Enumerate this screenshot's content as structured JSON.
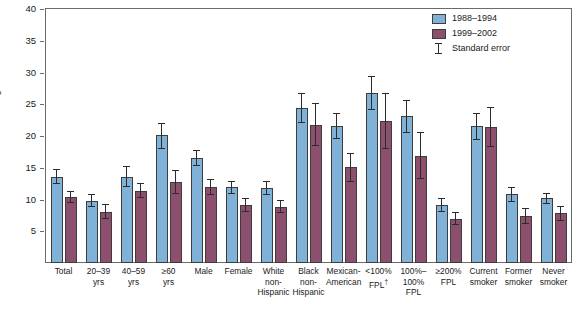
{
  "chart_data": {
    "type": "bar",
    "title": "",
    "xlabel": "",
    "ylabel": "Percentage",
    "ylim": [
      0,
      40
    ],
    "yticks": [
      0,
      5,
      10,
      15,
      20,
      25,
      30,
      35,
      40
    ],
    "ytick_labels": [
      "",
      "5",
      "10",
      "15",
      "20",
      "25",
      "30",
      "35",
      "40"
    ],
    "grid": false,
    "legend_position": "top-right",
    "legend": [
      "1988–1994",
      "1999–2002",
      "Standard error"
    ],
    "categories": [
      "Total",
      "20–39\nyrs",
      "40–59\nyrs",
      "≥60\nyrs",
      "Male",
      "Female",
      "White\nnon-\nHispanic",
      "Black\nnon-\nHispanic",
      "Mexican-\nAmerican",
      "<100%\nFPL†",
      "100%–\n100%\nFPL",
      "≥200%\nFPL",
      "Current\nsmoker",
      "Former\nsmoker",
      "Never\nsmoker"
    ],
    "series": [
      {
        "name": "1988–1994",
        "color": "#7fb2d6",
        "values": [
          13.6,
          9.8,
          13.6,
          20.1,
          16.5,
          11.9,
          11.8,
          24.4,
          21.6,
          26.8,
          23.1,
          9.2,
          21.5,
          10.8,
          10.2
        ],
        "err_low": [
          12.4,
          8.8,
          11.9,
          18.0,
          15.2,
          10.9,
          10.7,
          22.0,
          19.6,
          24.1,
          20.5,
          8.1,
          19.3,
          9.6,
          9.3
        ],
        "err_high": [
          14.8,
          10.8,
          15.3,
          22.1,
          17.8,
          12.9,
          12.9,
          26.8,
          23.6,
          29.5,
          25.7,
          10.3,
          23.7,
          12.0,
          11.1
        ]
      },
      {
        "name": "1999–2002",
        "color": "#8c4f6d",
        "values": [
          10.4,
          8.1,
          11.4,
          12.8,
          12.0,
          9.1,
          8.9,
          21.8,
          15.1,
          22.4,
          16.9,
          7.0,
          21.4,
          7.4,
          7.8
        ],
        "err_low": [
          9.4,
          6.9,
          10.2,
          10.9,
          10.7,
          8.0,
          7.9,
          18.4,
          12.8,
          18.0,
          13.2,
          6.0,
          18.3,
          6.1,
          6.6
        ],
        "err_high": [
          11.4,
          9.3,
          12.6,
          14.7,
          13.3,
          10.2,
          9.9,
          25.2,
          17.4,
          26.8,
          20.6,
          8.0,
          24.5,
          8.7,
          9.0
        ]
      }
    ]
  }
}
